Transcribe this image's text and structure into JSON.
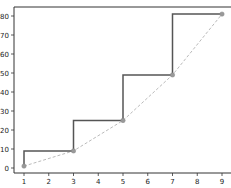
{
  "chart_data": {
    "type": "line",
    "title": "",
    "xlabel": "",
    "ylabel": "",
    "x": [
      1,
      3,
      5,
      7,
      9
    ],
    "series": [
      {
        "name": "step",
        "style": "step-pre",
        "color": "#555555",
        "values": [
          1,
          9,
          25,
          49,
          81
        ]
      },
      {
        "name": "points",
        "style": "dashed-with-markers",
        "color": "#bbbbbb",
        "marker_color": "#999999",
        "values": [
          1,
          9,
          25,
          49,
          81
        ]
      }
    ],
    "xlim": [
      0.6,
      9.4
    ],
    "ylim": [
      -3,
      84
    ],
    "xticks": [
      1,
      2,
      3,
      4,
      5,
      6,
      7,
      8,
      9
    ],
    "yticks": [
      0,
      10,
      20,
      30,
      40,
      50,
      60,
      70,
      80
    ],
    "grid": false,
    "legend": null
  }
}
